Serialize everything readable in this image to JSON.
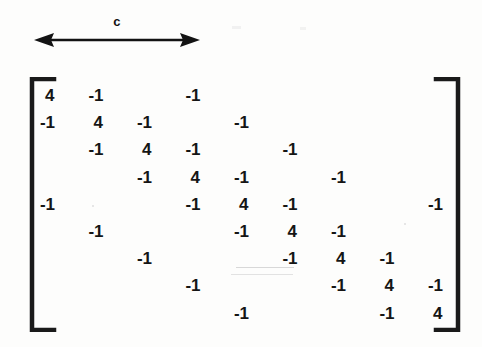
{
  "figure": {
    "bandwidth_label": "c",
    "arrow_icon": "double-headed-horizontal-arrow-icon",
    "left_bracket_icon": "matrix-left-bracket-icon",
    "right_bracket_icon": "matrix-right-bracket-icon"
  },
  "chart_data": {
    "type": "table",
    "annotations": [
      "c"
    ],
    "xlabel": "",
    "ylabel": "",
    "rows": 9,
    "cols": 9,
    "bandwidth": 3,
    "diagonal_value": "4",
    "offdiagonal_value": "-1",
    "cells": [
      {
        "row": 0,
        "col": 0,
        "value": "4",
        "kind": "diag"
      },
      {
        "row": 0,
        "col": 1,
        "value": "-1",
        "kind": "off"
      },
      {
        "row": 0,
        "col": 3,
        "value": "-1",
        "kind": "off"
      },
      {
        "row": 1,
        "col": 0,
        "value": "-1",
        "kind": "off"
      },
      {
        "row": 1,
        "col": 1,
        "value": "4",
        "kind": "diag"
      },
      {
        "row": 1,
        "col": 2,
        "value": "-1",
        "kind": "off"
      },
      {
        "row": 1,
        "col": 4,
        "value": "-1",
        "kind": "off"
      },
      {
        "row": 2,
        "col": 1,
        "value": "-1",
        "kind": "off"
      },
      {
        "row": 2,
        "col": 2,
        "value": "4",
        "kind": "diag"
      },
      {
        "row": 2,
        "col": 3,
        "value": "-1",
        "kind": "off"
      },
      {
        "row": 2,
        "col": 5,
        "value": "-1",
        "kind": "off"
      },
      {
        "row": 3,
        "col": 2,
        "value": "-1",
        "kind": "off"
      },
      {
        "row": 3,
        "col": 3,
        "value": "4",
        "kind": "diag"
      },
      {
        "row": 3,
        "col": 4,
        "value": "-1",
        "kind": "off"
      },
      {
        "row": 3,
        "col": 6,
        "value": "-1",
        "kind": "off"
      },
      {
        "row": 4,
        "col": 0,
        "value": "-1",
        "kind": "off"
      },
      {
        "row": 4,
        "col": 3,
        "value": "-1",
        "kind": "off"
      },
      {
        "row": 4,
        "col": 4,
        "value": "4",
        "kind": "diag"
      },
      {
        "row": 4,
        "col": 5,
        "value": "-1",
        "kind": "off"
      },
      {
        "row": 4,
        "col": 8,
        "value": "-1",
        "kind": "off"
      },
      {
        "row": 5,
        "col": 1,
        "value": "-1",
        "kind": "off"
      },
      {
        "row": 5,
        "col": 4,
        "value": "-1",
        "kind": "off"
      },
      {
        "row": 5,
        "col": 5,
        "value": "4",
        "kind": "diag"
      },
      {
        "row": 5,
        "col": 6,
        "value": "-1",
        "kind": "off"
      },
      {
        "row": 6,
        "col": 2,
        "value": "-1",
        "kind": "off"
      },
      {
        "row": 6,
        "col": 5,
        "value": "-1",
        "kind": "off"
      },
      {
        "row": 6,
        "col": 6,
        "value": "4",
        "kind": "diag"
      },
      {
        "row": 6,
        "col": 7,
        "value": "-1",
        "kind": "off"
      },
      {
        "row": 7,
        "col": 3,
        "value": "-1",
        "kind": "off"
      },
      {
        "row": 7,
        "col": 6,
        "value": "-1",
        "kind": "off"
      },
      {
        "row": 7,
        "col": 7,
        "value": "4",
        "kind": "diag"
      },
      {
        "row": 7,
        "col": 8,
        "value": "-1",
        "kind": "off"
      },
      {
        "row": 8,
        "col": 4,
        "value": "-1",
        "kind": "off"
      },
      {
        "row": 8,
        "col": 7,
        "value": "-1",
        "kind": "off"
      },
      {
        "row": 8,
        "col": 8,
        "value": "4",
        "kind": "diag"
      }
    ]
  },
  "layout": {
    "origin_x": 40,
    "origin_y": 86,
    "col_step": 48.5,
    "row_step": 27.2
  },
  "colors": {
    "ink": "#151515",
    "paper": "#fdfdfc"
  }
}
